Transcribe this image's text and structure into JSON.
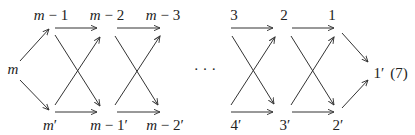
{
  "diagram": {
    "type": "commutative-diagram",
    "equation_number": "(7)",
    "ellipsis": "· · ·",
    "nodes": {
      "m": {
        "label": "m",
        "x": 13,
        "y": 74
      },
      "m1": {
        "label": "m − 1",
        "x": 51,
        "y": 20
      },
      "m2": {
        "label": "m − 2",
        "x": 107,
        "y": 20
      },
      "m3": {
        "label": "m − 3",
        "x": 163,
        "y": 20
      },
      "mp": {
        "label": "m′",
        "x": 50,
        "y": 130
      },
      "m1p": {
        "label": "m − 1′",
        "x": 109,
        "y": 130
      },
      "m2p": {
        "label": "m − 2′",
        "x": 165,
        "y": 130
      },
      "n3": {
        "label": "3",
        "x": 234,
        "y": 20
      },
      "n2": {
        "label": "2",
        "x": 284,
        "y": 20
      },
      "n1": {
        "label": "1",
        "x": 332,
        "y": 20
      },
      "n4p": {
        "label": "4′",
        "x": 236,
        "y": 130
      },
      "n3p": {
        "label": "3′",
        "x": 285,
        "y": 130
      },
      "n2p": {
        "label": "2′",
        "x": 338,
        "y": 130
      },
      "n1p": {
        "label": "1′",
        "x": 379,
        "y": 78
      }
    },
    "edges": [
      {
        "from": "m",
        "to": "m1",
        "x1": 20,
        "y1": 61,
        "x2": 49,
        "y2": 29
      },
      {
        "from": "m",
        "to": "mp",
        "x1": 20,
        "y1": 80,
        "x2": 49,
        "y2": 110
      },
      {
        "from": "m1",
        "to": "m2",
        "x1": 55,
        "y1": 28,
        "x2": 97,
        "y2": 28
      },
      {
        "from": "m1",
        "to": "m1p",
        "x1": 55,
        "y1": 35,
        "x2": 100,
        "y2": 106
      },
      {
        "from": "mp",
        "to": "m2",
        "x1": 55,
        "y1": 105,
        "x2": 100,
        "y2": 37
      },
      {
        "from": "mp",
        "to": "m1p",
        "x1": 55,
        "y1": 112,
        "x2": 97,
        "y2": 112
      },
      {
        "from": "m2",
        "to": "m3",
        "x1": 117,
        "y1": 28,
        "x2": 160,
        "y2": 28
      },
      {
        "from": "m2",
        "to": "m2p",
        "x1": 115,
        "y1": 36,
        "x2": 158,
        "y2": 105
      },
      {
        "from": "m1p",
        "to": "m3",
        "x1": 115,
        "y1": 105,
        "x2": 160,
        "y2": 36
      },
      {
        "from": "m1p",
        "to": "m2p",
        "x1": 117,
        "y1": 112,
        "x2": 160,
        "y2": 112
      },
      {
        "from": "n3",
        "to": "n2",
        "x1": 231,
        "y1": 28,
        "x2": 273,
        "y2": 28
      },
      {
        "from": "n3",
        "to": "n3p",
        "x1": 232,
        "y1": 36,
        "x2": 274,
        "y2": 104
      },
      {
        "from": "n4p",
        "to": "n2",
        "x1": 231,
        "y1": 105,
        "x2": 275,
        "y2": 37
      },
      {
        "from": "n4p",
        "to": "n3p",
        "x1": 231,
        "y1": 112,
        "x2": 273,
        "y2": 112
      },
      {
        "from": "n2",
        "to": "n1",
        "x1": 292,
        "y1": 28,
        "x2": 334,
        "y2": 28
      },
      {
        "from": "n2",
        "to": "n2p",
        "x1": 291,
        "y1": 36,
        "x2": 334,
        "y2": 105
      },
      {
        "from": "n3p",
        "to": "n1",
        "x1": 291,
        "y1": 105,
        "x2": 334,
        "y2": 37
      },
      {
        "from": "n3p",
        "to": "n2p",
        "x1": 292,
        "y1": 112,
        "x2": 334,
        "y2": 112
      },
      {
        "from": "n1",
        "to": "n1p",
        "x1": 342,
        "y1": 33,
        "x2": 368,
        "y2": 62
      },
      {
        "from": "n2p",
        "to": "n1p",
        "x1": 342,
        "y1": 108,
        "x2": 368,
        "y2": 80
      }
    ]
  }
}
